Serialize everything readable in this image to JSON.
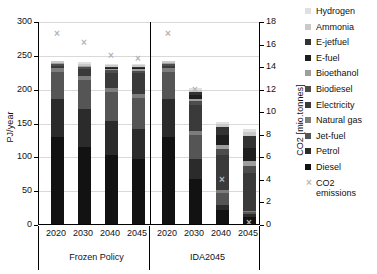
{
  "chart_data": {
    "type": "bar",
    "stacked": true,
    "title": "",
    "xlabel": "",
    "ylabel": "PJ/year",
    "y2label": "CO2 [mio.tonnes]",
    "ylim": [
      0,
      300
    ],
    "y2lim": [
      0,
      18
    ],
    "ytick_step": 50,
    "y2tick_step": 2,
    "grid": true,
    "legend_position": "right",
    "yticks": [
      "0",
      "50",
      "100",
      "150",
      "200",
      "250",
      "300"
    ],
    "y2ticks": [
      "0",
      "2",
      "4",
      "6",
      "8",
      "10",
      "12",
      "14",
      "16",
      "18"
    ],
    "groups": [
      "Frozen Policy",
      "IDA2045"
    ],
    "categories": [
      "2020",
      "2030",
      "2040",
      "2045",
      "2020",
      "2030",
      "2040",
      "2045"
    ],
    "group_of_category": [
      "Frozen Policy",
      "Frozen Policy",
      "Frozen Policy",
      "Frozen Policy",
      "IDA2045",
      "IDA2045",
      "IDA2045",
      "IDA2045"
    ],
    "series": [
      {
        "name": "Diesel",
        "color": "#121212",
        "values": [
          130,
          115,
          103,
          97,
          130,
          68,
          22,
          12
        ]
      },
      {
        "name": "Petrol",
        "color": "#2b2b2b",
        "values": [
          56,
          57,
          50,
          45,
          56,
          29,
          8,
          4
        ]
      },
      {
        "name": "Jet-fuel",
        "color": "#555555",
        "values": [
          40,
          42,
          44,
          46,
          40,
          36,
          18,
          3
        ]
      },
      {
        "name": "Natural gas",
        "color": "#7d7d7d",
        "values": [
          6,
          6,
          6,
          6,
          6,
          6,
          4,
          2
        ]
      },
      {
        "name": "Electricity",
        "color": "#3a3a3a",
        "values": [
          3,
          10,
          22,
          30,
          3,
          38,
          52,
          56
        ]
      },
      {
        "name": "Biodiesel",
        "color": "#4d4d4d",
        "values": [
          3,
          3,
          4,
          4,
          3,
          6,
          9,
          10
        ]
      },
      {
        "name": "Bioethanol",
        "color": "#9e9e9e",
        "values": [
          2,
          2,
          2,
          2,
          2,
          4,
          6,
          7
        ]
      },
      {
        "name": "E-fuel",
        "color": "#1e1e1e",
        "values": [
          0,
          0,
          1,
          2,
          0,
          5,
          14,
          20
        ]
      },
      {
        "name": "E-jetfuel",
        "color": "#333333",
        "values": [
          0,
          0,
          1,
          1,
          0,
          5,
          12,
          18
        ]
      },
      {
        "name": "Ammonia",
        "color": "#c9c9c9",
        "values": [
          2,
          3,
          3,
          3,
          2,
          3,
          4,
          5
        ]
      },
      {
        "name": "Hydrogen",
        "color": "#e0e0e0",
        "values": [
          1,
          3,
          2,
          2,
          1,
          2,
          3,
          5
        ]
      }
    ],
    "overlay": {
      "name": "CO2 emissions",
      "marker": "x",
      "color": "#b5b5b5",
      "axis": "right",
      "values": [
        17.0,
        16.2,
        15.0,
        14.8,
        17.0,
        12.0,
        4.0,
        0.2
      ]
    },
    "legend_entries": [
      {
        "label": "Hydrogen",
        "color": "#e0e0e0",
        "marker": "square"
      },
      {
        "label": "Ammonia",
        "color": "#c9c9c9",
        "marker": "square"
      },
      {
        "label": "E-jetfuel",
        "color": "#333333",
        "marker": "square"
      },
      {
        "label": "E-fuel",
        "color": "#1e1e1e",
        "marker": "square"
      },
      {
        "label": "Bioethanol",
        "color": "#9e9e9e",
        "marker": "square"
      },
      {
        "label": "Biodiesel",
        "color": "#4d4d4d",
        "marker": "square"
      },
      {
        "label": "Electricity",
        "color": "#3a3a3a",
        "marker": "square"
      },
      {
        "label": "Natural gas",
        "color": "#7d7d7d",
        "marker": "square"
      },
      {
        "label": "Jet-fuel",
        "color": "#555555",
        "marker": "square"
      },
      {
        "label": "Petrol",
        "color": "#2b2b2b",
        "marker": "square"
      },
      {
        "label": "Diesel",
        "color": "#121212",
        "marker": "square"
      },
      {
        "label": "CO2 emissions",
        "color": "#b9b9b9",
        "marker": "x"
      }
    ]
  }
}
